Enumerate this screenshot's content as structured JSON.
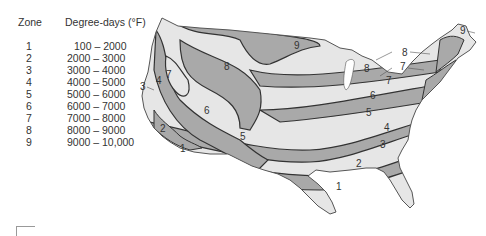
{
  "legend": {
    "zone_header": "Zone",
    "range_header": "Degree-days (°F)",
    "rows": [
      {
        "zone": "1",
        "range": "100 – 2000"
      },
      {
        "zone": "2",
        "range": "2000 – 3000"
      },
      {
        "zone": "3",
        "range": "3000 – 4000"
      },
      {
        "zone": "4",
        "range": "4000 – 5000"
      },
      {
        "zone": "5",
        "range": "5000 – 6000"
      },
      {
        "zone": "6",
        "range": "6000 – 7000"
      },
      {
        "zone": "7",
        "range": "7000 – 8000"
      },
      {
        "zone": "8",
        "range": "8000 – 9000"
      },
      {
        "zone": "9",
        "range": "9000 – 10,000"
      }
    ]
  },
  "map": {
    "title": "",
    "colors": {
      "light": "#e6e6e6",
      "dark": "#a9a9a9",
      "border": "#333333"
    },
    "labels": [
      {
        "text": "9",
        "x": 154,
        "y": 49
      },
      {
        "text": "8",
        "x": 221,
        "y": 71
      },
      {
        "text": "8",
        "x": 226,
        "y": 70
      },
      {
        "text": "7",
        "x": 249,
        "y": 82
      },
      {
        "text": "6",
        "x": 229,
        "y": 97
      },
      {
        "text": "5",
        "x": 227,
        "y": 115
      },
      {
        "text": "4",
        "x": 244,
        "y": 129
      },
      {
        "text": "3",
        "x": 239,
        "y": 146
      },
      {
        "text": "2",
        "x": 213,
        "y": 164
      },
      {
        "text": "1",
        "x": 192,
        "y": 188
      },
      {
        "text": "7",
        "x": 27,
        "y": 75
      },
      {
        "text": "8",
        "x": 86,
        "y": 68
      },
      {
        "text": "6",
        "x": 66,
        "y": 112
      },
      {
        "text": "5",
        "x": 102,
        "y": 141
      },
      {
        "text": "2",
        "x": 22,
        "y": 130
      },
      {
        "text": "1",
        "x": 41,
        "y": 150
      },
      {
        "text": "4",
        "x": 17,
        "y": 82
      }
    ],
    "callouts": [
      {
        "text": "9",
        "x": 324,
        "y": 33
      },
      {
        "text": "8",
        "x": 261,
        "y": 55
      },
      {
        "text": "7",
        "x": 258,
        "y": 70
      },
      {
        "text": "3",
        "x": 0,
        "y": 88
      }
    ]
  }
}
